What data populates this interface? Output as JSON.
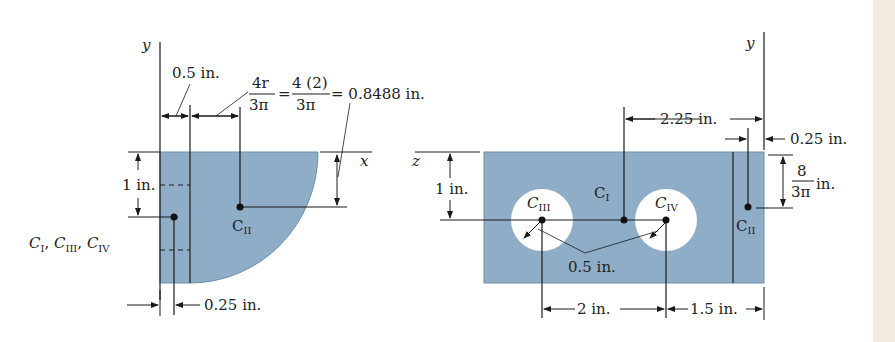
{
  "colors": {
    "fill": "#8fadc6",
    "line": "#1a1a1a",
    "background": "#ffffff",
    "edge_strip": "#f1ebe0"
  },
  "left_figure": {
    "axis_y": "y",
    "axis_x": "x",
    "dim_0_5": "0.5 in.",
    "formula_lhs_num": "4r",
    "formula_lhs_den": "3π",
    "formula_eq1": "=",
    "formula_mid_num": "4 (2)",
    "formula_mid_den": "3π",
    "formula_result": "= 0.8488 in.",
    "dim_1": "1 in.",
    "dim_0_25": "0.25 in.",
    "centroid_group_label": {
      "C1": "C",
      "C1_sub": "I",
      "sep1": ", ",
      "C3": "C",
      "C3_sub": "III",
      "sep2": ", ",
      "C4": "C",
      "C4_sub": "IV"
    },
    "centroid_II": {
      "main": "C",
      "sub": "II"
    }
  },
  "right_figure": {
    "axis_y": "y",
    "axis_z": "z",
    "dim_2_25": "2.25 in.",
    "dim_0_25": "0.25 in.",
    "dim_8_num": "8",
    "dim_8_den": "3π",
    "dim_8_unit": "in.",
    "dim_1": "1 in.",
    "dim_0_5": "0.5 in.",
    "dim_2": "2 in.",
    "dim_1_5": "1.5 in.",
    "centroid_I": {
      "main": "C",
      "sub": "I"
    },
    "centroid_III": {
      "main": "C",
      "sub": "III"
    },
    "centroid_IV": {
      "main": "C",
      "sub": "IV"
    },
    "centroid_II": {
      "main": "C",
      "sub": "II"
    }
  }
}
